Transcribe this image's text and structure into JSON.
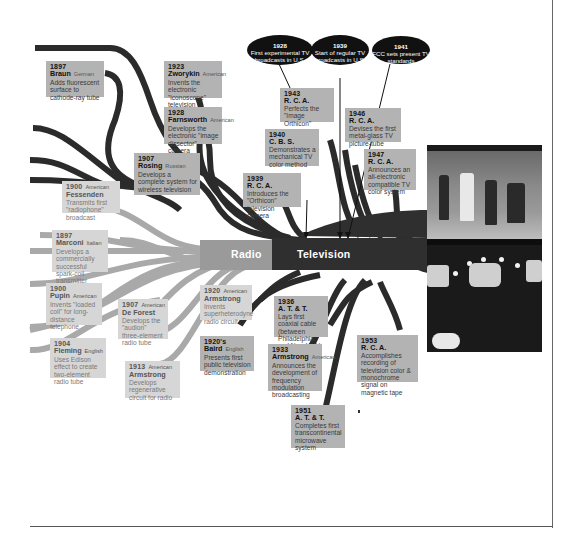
{
  "diagram": {
    "trunks": {
      "radio_label": "Radio",
      "television_label": "Television"
    },
    "colors": {
      "radio_branch": "#a8a8a8",
      "television_branch": "#2e2e2e",
      "card_dark": "#b3b3b3",
      "card_light": "#d6d6d6",
      "oval_bg": "#111111"
    },
    "milestones_ovals": [
      {
        "year": "1928",
        "text": "First experimental TV broadcasts in U.S."
      },
      {
        "year": "1939",
        "text": "Start of regular TV broadcasts in U.S."
      },
      {
        "year": "1941",
        "text": "FCC sets present TV standards"
      }
    ],
    "television_cards": [
      {
        "year": "1897",
        "name": "Braun",
        "nationality": "German",
        "desc": "Adds fluorescent surface to cathode-ray tube"
      },
      {
        "year": "1923",
        "name": "Zworykin",
        "nationality": "American",
        "desc": "Invents the electronic \"iconoscope\" television camera"
      },
      {
        "year": "1928",
        "name": "Farnsworth",
        "nationality": "American",
        "desc": "Develops the electronic \"image dissector\" camera"
      },
      {
        "year": "1907",
        "name": "Rosing",
        "nationality": "Russian",
        "desc": "Develops a complete system for wireless television"
      },
      {
        "year": "1943",
        "name": "R. C. A.",
        "nationality": "",
        "desc": "Perfects the \"Image Orthicon\" camera"
      },
      {
        "year": "1940",
        "name": "C. B. S.",
        "nationality": "",
        "desc": "Demonstrates a mechanical TV color method"
      },
      {
        "year": "1939",
        "name": "R. C. A.",
        "nationality": "",
        "desc": "Introduces the \"Orthicon\" television camera"
      },
      {
        "year": "1946",
        "name": "R. C. A.",
        "nationality": "",
        "desc": "Devises the first metal-glass TV picture-tube"
      },
      {
        "year": "1947",
        "name": "R. C. A.",
        "nationality": "",
        "desc": "Announces an all-electronic compatible TV color system"
      },
      {
        "year": "1920's",
        "name": "Baird",
        "nationality": "English",
        "desc": "Presents first public television demonstration"
      },
      {
        "year": "1936",
        "name": "A. T. & T.",
        "nationality": "",
        "desc": "Lays first coaxial cable (between Philadelphia and New York)"
      },
      {
        "year": "1933",
        "name": "Armstrong",
        "nationality": "American",
        "desc": "Announces the development of frequency modulation broadcasting"
      },
      {
        "year": "1953",
        "name": "R. C. A.",
        "nationality": "",
        "desc": "Accomplishes recording of television color & monochrome signal on magnetic tape"
      },
      {
        "year": "1951",
        "name": "A. T. & T.",
        "nationality": "",
        "desc": "Completes first transcontinental microwave system"
      }
    ],
    "radio_cards": [
      {
        "year": "1900",
        "name": "Fessenden",
        "nationality": "American",
        "desc": "Transmits first \"radiophone\" broadcast"
      },
      {
        "year": "1897",
        "name": "Marconi",
        "nationality": "Italian",
        "desc": "Develops a commercially successful spark-coil transmitter"
      },
      {
        "year": "1900",
        "name": "Pupin",
        "nationality": "American",
        "desc": "Invents \"loaded coil\" for long-distance telephone"
      },
      {
        "year": "1907",
        "name": "De Forest",
        "nationality": "American",
        "desc": "Develops the \"audion\" three-element radio tube"
      },
      {
        "year": "1904",
        "name": "Fleming",
        "nationality": "English",
        "desc": "Uses Edison effect to create two-element radio tube"
      },
      {
        "year": "1913",
        "name": "Armstrong",
        "nationality": "American",
        "desc": "Develops regenerative circuit for radio"
      },
      {
        "year": "1920",
        "name": "Armstrong",
        "nationality": "American",
        "desc": "Invents superheterodyne radio circuit"
      }
    ],
    "photo": {
      "subject": "television-studio-photograph"
    }
  }
}
